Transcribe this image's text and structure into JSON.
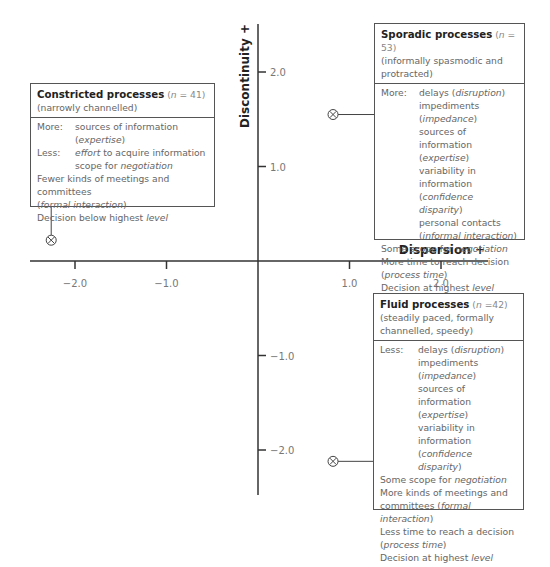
{
  "chart_data": {
    "type": "scatter",
    "title": "",
    "xlabel": "Dispersion +",
    "ylabel": "Discontinuity +",
    "xlim": [
      -2.5,
      2.5
    ],
    "ylim": [
      -2.5,
      2.5
    ],
    "x_ticks": [
      -2.0,
      -1.0,
      1.0,
      2.0
    ],
    "x_tick_labels": [
      "−2.0",
      "−1.0",
      "1.0",
      "2.0"
    ],
    "y_ticks": [
      2.0,
      1.0,
      -1.0,
      -2.0
    ],
    "y_tick_labels": [
      "2.0",
      "1.0",
      "−1.0",
      "−2.0"
    ],
    "grid": false,
    "points": [
      {
        "name": "Constricted processes",
        "x": -2.26,
        "y": 0.22,
        "marker": "circled-x"
      },
      {
        "name": "Sporadic processes",
        "x": 0.82,
        "y": 1.55,
        "marker": "circled-x"
      },
      {
        "name": "Fluid processes",
        "x": 0.82,
        "y": -2.12,
        "marker": "circled-x"
      }
    ]
  },
  "boxes": {
    "constricted": {
      "title": "Constricted processes",
      "n_prefix": "(",
      "n_var": "n",
      "n_value": " = 41)",
      "subtitle": "(narrowly channelled)",
      "more_label": "More:",
      "more_items": [
        "sources of information (",
        "expertise",
        ")"
      ],
      "less_label": "Less:",
      "less_item1_it": "effort",
      "less_item1_rest": " to acquire information",
      "less_item2_pre": "scope for ",
      "less_item2_it": "negotiation",
      "line1": "Fewer kinds of meetings and committees",
      "line2_pre": "(",
      "line2_it": "formal interaction",
      "line2_post": ")",
      "line3_pre": "Decision below highest ",
      "line3_it": "level"
    },
    "sporadic": {
      "title": "Sporadic processes",
      "n_prefix": "(",
      "n_var": "n",
      "n_value": " = 53)",
      "subtitle": "(informally spasmodic and protracted)",
      "more_label": "More:",
      "m1_pre": "delays (",
      "m1_it": "disruption",
      "m1_post": ")",
      "m2_pre": "impediments (",
      "m2_it": "impedance",
      "m2_post": ")",
      "m3": "sources of information",
      "m4_pre": "(",
      "m4_it": "expertise",
      "m4_post": ")",
      "m5": "variability in information",
      "m6_pre": "(",
      "m6_it": "confidence disparity",
      "m6_post": ")",
      "m7": "personal contacts",
      "m8_pre": "(",
      "m8_it": "informal interaction",
      "m8_post": ")",
      "l1_pre": "Some scope for ",
      "l1_it": "negotiation",
      "l2": "More time to reach decision",
      "l3_pre": "(",
      "l3_it": "process time",
      "l3_post": ")",
      "l4_pre": "Decision at highest ",
      "l4_it": "level"
    },
    "fluid": {
      "title": "Fluid processes",
      "n_prefix": "(",
      "n_var": "n",
      "n_value": " =42)",
      "subtitle": "(steadily paced, formally channelled, speedy)",
      "less_label": "Less:",
      "m1_pre": "delays (",
      "m1_it": "disruption",
      "m1_post": ")",
      "m2_pre": "impediments (",
      "m2_it": "impedance",
      "m2_post": ")",
      "m3": "sources of information",
      "m4_pre": "(",
      "m4_it": "expertise",
      "m4_post": ")",
      "m5": "variability in information",
      "m6_pre": "(",
      "m6_it": "confidence disparity",
      "m6_post": ")",
      "l1_pre": "Some scope for ",
      "l1_it": "negotiation",
      "l2": "More kinds of meetings and",
      "l3_pre": "committees (",
      "l3_it": "formal interaction",
      "l3_post": ")",
      "l4": "Less time to reach a decision",
      "l5_pre": "(",
      "l5_it": "process time",
      "l5_post": ")",
      "l6_pre": "Decision at highest ",
      "l6_it": "level"
    }
  },
  "colors": {
    "axis": "#333333",
    "box_border": "#555555",
    "text": "#666666",
    "title": "#222222"
  }
}
